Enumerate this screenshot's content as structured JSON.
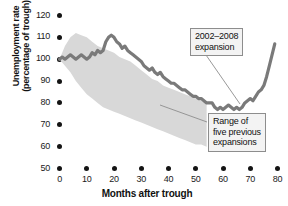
{
  "chart_data": {
    "type": "line",
    "title": "",
    "xlabel": "Months after trough",
    "ylabel_line1": "Unemployment rate",
    "ylabel_line2": "(percentage of trough)",
    "xlim": [
      0,
      80
    ],
    "ylim": [
      50,
      120
    ],
    "xticks": [
      0,
      10,
      20,
      30,
      40,
      50,
      60,
      70,
      80
    ],
    "yticks": [
      50,
      60,
      70,
      80,
      90,
      100,
      110,
      120
    ],
    "grid": false,
    "legend_position": "annotations",
    "colors": {
      "line": "#7a7a7a",
      "line_edge": "#6b6b6b",
      "band": "#d8d8d8",
      "axis_text": "#1a1a1a",
      "callout_bg": "#f3f3f3",
      "callout_border": "#8d8d8d"
    },
    "series": [
      {
        "name": "2002-2008 expansion",
        "type": "line",
        "x": [
          0,
          1,
          2,
          3,
          4,
          5,
          6,
          7,
          8,
          9,
          10,
          11,
          12,
          13,
          14,
          15,
          16,
          17,
          18,
          19,
          20,
          21,
          22,
          23,
          24,
          25,
          26,
          27,
          28,
          29,
          30,
          31,
          32,
          33,
          34,
          35,
          36,
          37,
          38,
          39,
          40,
          41,
          42,
          43,
          44,
          45,
          46,
          47,
          48,
          49,
          50,
          51,
          52,
          53,
          54,
          55,
          56,
          57,
          58,
          59,
          60,
          61,
          62,
          63,
          64,
          65,
          66,
          67,
          68,
          69,
          70,
          71,
          72,
          73,
          74,
          75,
          76,
          77,
          78,
          79
        ],
        "values": [
          100,
          101,
          100,
          101,
          102,
          101,
          100,
          101,
          102,
          101,
          100,
          101,
          103,
          102,
          104,
          103,
          104,
          108,
          110,
          111,
          110,
          108,
          107,
          105,
          106,
          104,
          103,
          102,
          101,
          100,
          99,
          97,
          96,
          95,
          96,
          94,
          93,
          94,
          92,
          91,
          90,
          89,
          89,
          88,
          87,
          86,
          86,
          85,
          84,
          83,
          83,
          82,
          82,
          81,
          80,
          80,
          80,
          78,
          77,
          78,
          77,
          78,
          79,
          78,
          77,
          78,
          77,
          78,
          80,
          81,
          82,
          81,
          83,
          85,
          86,
          88,
          92,
          97,
          102,
          107
        ]
      },
      {
        "name": "Range of five previous expansions",
        "type": "band",
        "x": [
          0,
          2,
          4,
          6,
          8,
          10,
          12,
          14,
          16,
          18,
          20,
          22,
          24,
          26,
          28,
          30,
          32,
          34,
          36,
          38,
          40,
          42,
          44,
          46,
          48,
          50,
          52,
          54
        ],
        "upper": [
          100,
          106,
          110,
          112,
          111,
          110,
          108,
          106,
          105,
          104,
          103,
          101,
          100,
          99,
          97,
          95,
          93,
          91,
          90,
          88,
          87,
          86,
          85,
          84,
          83,
          82,
          81,
          80
        ],
        "lower": [
          100,
          97,
          94,
          90,
          87,
          84,
          82,
          80,
          78,
          77,
          76,
          75,
          74,
          73,
          72,
          71,
          70,
          69,
          68,
          67,
          66,
          65,
          64,
          63,
          62,
          61,
          61,
          60
        ]
      }
    ],
    "annotations": [
      {
        "name": "expansion-callout",
        "lines": [
          "2002–2008",
          "expansion"
        ],
        "box": {
          "x": 190,
          "y": 28,
          "w": 62,
          "h": 26
        },
        "leader": {
          "x1": 206,
          "y1": 55,
          "x2": 240,
          "y2": 104
        }
      },
      {
        "name": "range-callout",
        "lines": [
          "Range of",
          "five previous",
          "expansions"
        ],
        "box": {
          "x": 208,
          "y": 113,
          "w": 66,
          "h": 38
        },
        "leader": {
          "x1": 207,
          "y1": 122,
          "x2": 160,
          "y2": 105
        }
      }
    ]
  }
}
